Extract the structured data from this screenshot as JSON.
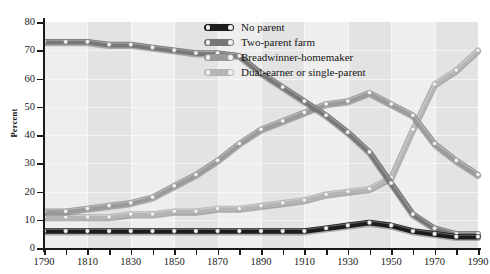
{
  "chart_data": {
    "type": "line",
    "title": "",
    "xlabel": "",
    "ylabel": "Percent",
    "xlim": [
      1790,
      1990
    ],
    "ylim": [
      0,
      80
    ],
    "x": [
      1790,
      1800,
      1810,
      1820,
      1830,
      1840,
      1850,
      1860,
      1870,
      1880,
      1890,
      1900,
      1910,
      1920,
      1930,
      1940,
      1950,
      1960,
      1970,
      1980,
      1990
    ],
    "ytick_labels": [
      "0",
      "10",
      "20",
      "30",
      "40",
      "50",
      "60",
      "70",
      "80"
    ],
    "xtick_labels": [
      "1790",
      "1810",
      "1830",
      "1850",
      "1870",
      "1890",
      "1910",
      "1930",
      "1950",
      "1970",
      "1990"
    ],
    "grid": true,
    "legend_position": "top-center",
    "series": [
      {
        "name": "No parent",
        "color": "#1c1c1c",
        "values": [
          6,
          6,
          6,
          6,
          6,
          6,
          6,
          6,
          6,
          6,
          6,
          6,
          6,
          7,
          8,
          9,
          8,
          6,
          5,
          4,
          4
        ]
      },
      {
        "name": "Two-parent farm",
        "color": "#777777",
        "values": [
          73,
          73,
          73,
          72,
          72,
          71,
          70,
          69,
          69,
          68,
          62,
          57,
          52,
          47,
          41,
          34,
          23,
          12,
          7,
          5,
          5
        ]
      },
      {
        "name": "Breadwinner-homemaker",
        "color": "#9a9a9a",
        "values": [
          13,
          13,
          14,
          15,
          16,
          18,
          22,
          26,
          31,
          37,
          42,
          45,
          48,
          51,
          52,
          55,
          51,
          47,
          37,
          31,
          26
        ]
      },
      {
        "name": "Dual-earner or single-parent",
        "color": "#b5b5b5",
        "values": [
          11,
          11,
          11,
          11,
          12,
          12,
          13,
          13,
          14,
          14,
          15,
          16,
          17,
          19,
          20,
          21,
          25,
          42,
          58,
          63,
          70
        ]
      }
    ]
  }
}
